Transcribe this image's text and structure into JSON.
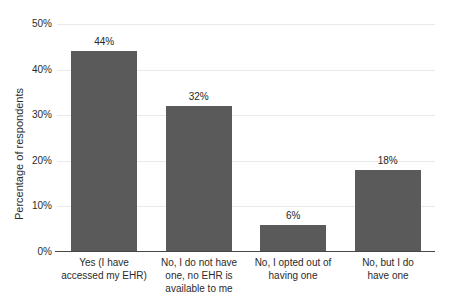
{
  "chart_data": {
    "type": "bar",
    "title": "",
    "xlabel": "",
    "ylabel": "Percentage of respondents",
    "categories": [
      "Yes (I have\naccessed my EHR)",
      "No, I do not have\none, no EHR is\navailable to me",
      "No, I opted out of\nhaving one",
      "No, but I do\nhave one"
    ],
    "values": [
      44,
      32,
      6,
      18
    ],
    "data_labels": [
      "44%",
      "32%",
      "6%",
      "18%"
    ],
    "ylim": [
      0,
      50
    ],
    "yticks": [
      "0%",
      "10%",
      "20%",
      "30%",
      "40%",
      "50%"
    ],
    "grid": "horizontal",
    "legend": "none",
    "bar_color": "#5a5a5a"
  }
}
